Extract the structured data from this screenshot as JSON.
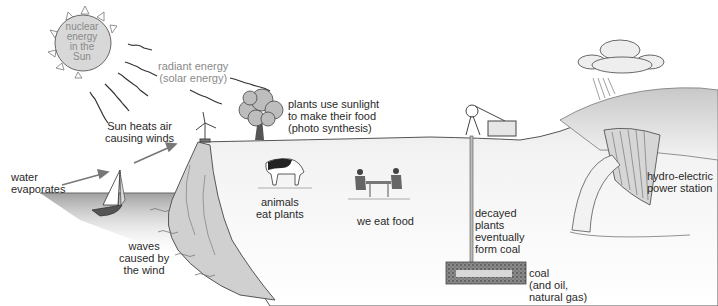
{
  "diagram": {
    "labels": {
      "sun": "nuclear\nenergy\nin the\nSun",
      "radiant": "radiant energy\n(solar energy)",
      "photosynthesis": "plants use sunlight\nto make their food\n(photo synthesis)",
      "winds": "Sun heats air\ncausing winds",
      "evaporation": "water\nevaporates",
      "waves": "waves\ncaused by\nthe wind",
      "animals": "animals\neat plants",
      "food": "we eat food",
      "decay": "decayed\nplants\neventually\nform coal",
      "coal": "coal\n(and oil,\nnatural gas)",
      "hydro": "hydro-electric\npower station"
    },
    "elements": [
      "sun",
      "radiant-rays",
      "tree",
      "wind-turbine",
      "sailboat",
      "sea",
      "cliff",
      "cow",
      "people-at-table",
      "mine-headframe",
      "mine-shaft",
      "coal-seam",
      "hill",
      "rain-cloud",
      "dam"
    ],
    "colors": {
      "line": "#444444",
      "sun_fill": "#d8d8d8",
      "ground": "#eeeeee",
      "sea": "#a8a8a8",
      "label": "#2a2a2a",
      "label_grey": "#8a8a8a"
    }
  }
}
